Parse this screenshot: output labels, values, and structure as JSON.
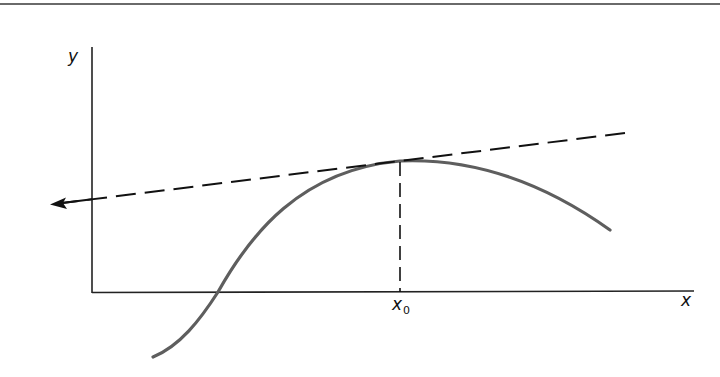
{
  "diagram": {
    "labels": {
      "y_axis": "y",
      "x_axis": "x",
      "x0_base": "x",
      "x0_sub": "0"
    },
    "elements": {
      "curve": "smooth function with a local maximum at x0",
      "tangent": "dashed tangent line at x0 (horizontal-ish, slightly rising), arrow pointing left",
      "drop_line": "vertical dashed line from point of tangency down to x-axis at x0"
    },
    "colors": {
      "curve": "#5e5e5e",
      "axes": "#222222",
      "tangent": "#111111",
      "top_rule": "#6a6a6a"
    }
  }
}
